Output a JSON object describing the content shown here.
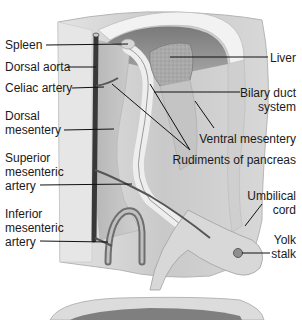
{
  "diagram": {
    "style": "grayscale anatomical illustration",
    "labels_left": [
      {
        "id": "spleen",
        "text": "Spleen"
      },
      {
        "id": "dorsal-aorta",
        "text": "Dorsal aorta"
      },
      {
        "id": "celiac-artery",
        "text": "Celiac artery"
      },
      {
        "id": "dorsal-mesentery",
        "line1": "Dorsal",
        "line2": "mesentery"
      },
      {
        "id": "superior-mesenteric-artery",
        "line1": "Superior",
        "line2": "mesenteric",
        "line3": "artery"
      },
      {
        "id": "inferior-mesenteric-artery",
        "line1": "Inferior",
        "line2": "mesenteric",
        "line3": "artery"
      }
    ],
    "labels_right": [
      {
        "id": "liver",
        "text": "Liver"
      },
      {
        "id": "biliary-duct-system",
        "line1": "Bilary duct",
        "line2": "system"
      },
      {
        "id": "ventral-mesentery",
        "text": "Ventral mesentery"
      },
      {
        "id": "rudiments-of-pancreas",
        "text": "Rudiments of pancreas"
      },
      {
        "id": "umbilical-cord",
        "line1": "Umbilical",
        "line2": "cord"
      },
      {
        "id": "yolk-stalk",
        "line1": "Yolk",
        "line2": "stalk"
      }
    ],
    "colors": {
      "background": "#ffffff",
      "body_wall": "#dcdcdc",
      "cavity": "#8e8e8e",
      "aorta": "#3a3a3a",
      "liver": "#a8a8a8",
      "leader_lines": "#111111",
      "text": "#1a1a1a"
    }
  }
}
